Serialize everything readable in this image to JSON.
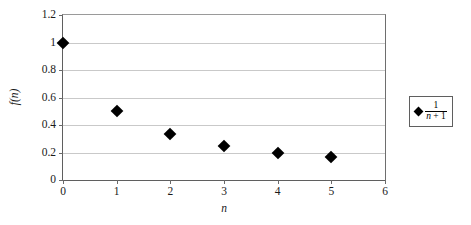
{
  "chart_data": {
    "type": "scatter",
    "title": "",
    "xlabel": "n",
    "ylabel": "f(n)",
    "xlim": [
      0,
      6
    ],
    "ylim": [
      0,
      1.2
    ],
    "grid": true,
    "legend_position": "right",
    "marker": "diamond",
    "marker_color": "#000000",
    "x": [
      0,
      1,
      2,
      3,
      4,
      5
    ],
    "series": [
      {
        "name": "1/(n + 1)",
        "values": [
          1,
          0.5,
          0.3333,
          0.25,
          0.2,
          0.1667
        ]
      }
    ],
    "xticks": [
      "0",
      "1",
      "2",
      "3",
      "4",
      "5",
      "6"
    ],
    "xtick_values": [
      0,
      1,
      2,
      3,
      4,
      5,
      6
    ],
    "yticks": [
      "0",
      "0.2",
      "0.4",
      "0.6",
      "0.8",
      "1",
      "1.2"
    ],
    "ytick_values": [
      0,
      0.2,
      0.4,
      0.6,
      0.8,
      1,
      1.2
    ]
  },
  "legend": {
    "entries": [
      {
        "numerator": "1",
        "denominator_variable": "n",
        "denominator_operator": " + ",
        "denominator_constant": "1",
        "marker": "diamond"
      }
    ]
  },
  "axes": {
    "x_title": "n",
    "y_title": "f(n)"
  }
}
